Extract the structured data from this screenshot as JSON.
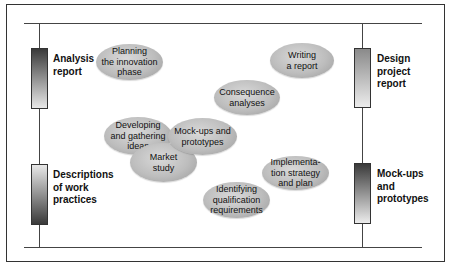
{
  "diagram": {
    "left_outputs": [
      {
        "label": "Analysis\nreport",
        "gradient": "dark-to-light"
      },
      {
        "label": "Descriptions\nof work\npractices",
        "gradient": "light-to-dark"
      }
    ],
    "right_outputs": [
      {
        "label": "Design\nproject\nreport",
        "gradient": "medium-to-light"
      },
      {
        "label": "Mock-ups\nand\nprototypes",
        "gradient": "dark-to-light"
      }
    ],
    "activities": [
      {
        "label": "Planning\nthe innovation\nphase"
      },
      {
        "label": "Writing\na report"
      },
      {
        "label": "Consequence\nanalyses"
      },
      {
        "label": "Developing\nand gathering\nideas"
      },
      {
        "label": "Mock-ups and\nprototypes"
      },
      {
        "label": "Market\nstudy"
      },
      {
        "label": "Implementa-\ntion strategy\nand plan"
      },
      {
        "label": "Identifying\nqualification\nrequirements"
      }
    ],
    "colors": {
      "line": "#444444",
      "ellipse_fill": "#bdbdbd",
      "bar_dark": "#3a3a3a",
      "bar_light": "#e8e8e8"
    }
  }
}
